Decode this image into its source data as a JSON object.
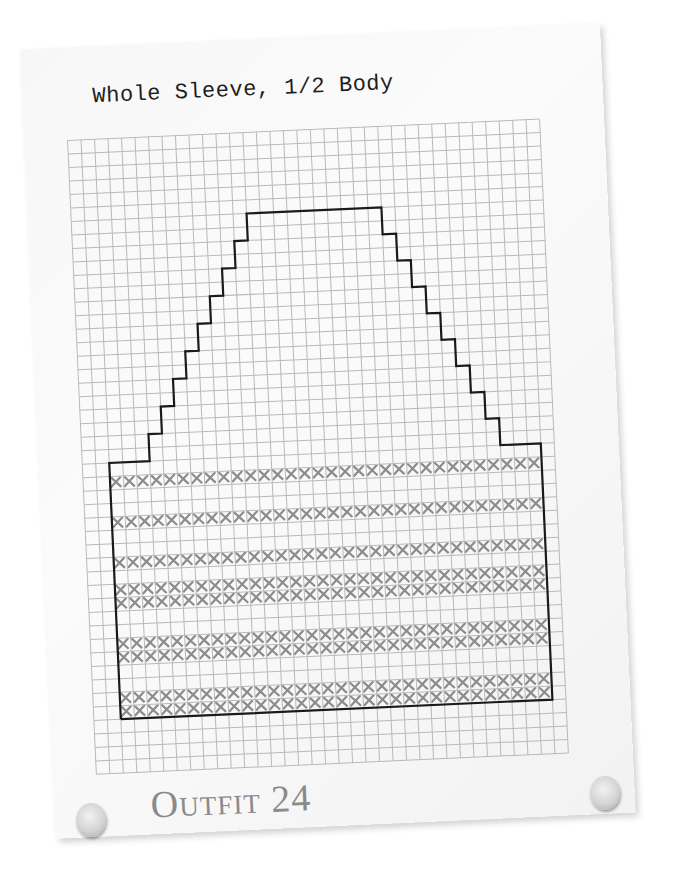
{
  "title": "Whole Sleeve, 1/2 Body",
  "footer_label": "Outfit 24",
  "colors": {
    "paper": "#f7f7f7",
    "grid_line": "#b9b9b9",
    "outline": "#1a1a1a",
    "stitch_x": "#8c8c8c",
    "title_text": "#1e1e1e",
    "footer_text": "#8a8a8a"
  },
  "chart": {
    "grid_columns": 35,
    "grid_rows": 47,
    "cell_px": 13.5,
    "shape": {
      "rect_start_col": 2,
      "rect_width_cols": 32,
      "rect_top_row": 24,
      "rect_height_rows": 19,
      "left_flat_cols": 3,
      "steps_per_side": 9,
      "step_width_cols": 1,
      "step_height_rows": 2,
      "top_flat_cols": 10
    },
    "stripes": [
      {
        "row_offset": 1,
        "rows": 1
      },
      {
        "row_offset": 4,
        "rows": 1
      },
      {
        "row_offset": 7,
        "rows": 1
      },
      {
        "row_offset": 9,
        "rows": 2
      },
      {
        "row_offset": 13,
        "rows": 2
      },
      {
        "row_offset": 17,
        "rows": 2
      }
    ]
  }
}
